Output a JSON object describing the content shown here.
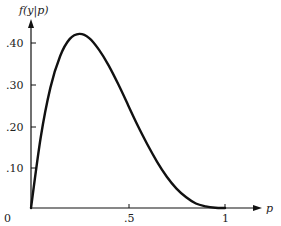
{
  "chart_data": {
    "type": "line",
    "title": "",
    "xlabel": "p",
    "ylabel": "f(y|p)",
    "xlim": [
      0,
      1
    ],
    "ylim": [
      0,
      0.45
    ],
    "grid": false,
    "legend": null,
    "x_ticks": [
      "0",
      ".5",
      "1"
    ],
    "y_ticks": [
      ".10",
      ".20",
      ".30",
      ".40"
    ],
    "origin_label": "0",
    "series": [
      {
        "name": "f(y|p)",
        "x": [
          0,
          0.05,
          0.1,
          0.15,
          0.2,
          0.25,
          0.3,
          0.35,
          0.4,
          0.45,
          0.5,
          0.55,
          0.6,
          0.65,
          0.7,
          0.75,
          0.8,
          0.85,
          0.9,
          0.95,
          1.0
        ],
        "values": [
          0,
          0.171,
          0.292,
          0.368,
          0.41,
          0.422,
          0.412,
          0.384,
          0.346,
          0.3,
          0.25,
          0.2,
          0.154,
          0.112,
          0.076,
          0.047,
          0.026,
          0.011,
          0.004,
          0.0005,
          0
        ]
      }
    ]
  },
  "labels": {
    "ylabel": "f(y|p)",
    "xlabel": "p",
    "origin": "0",
    "x_half": ".5",
    "x_one": "1",
    "y10": ".10",
    "y20": ".20",
    "y30": ".30",
    "y40": ".40"
  }
}
